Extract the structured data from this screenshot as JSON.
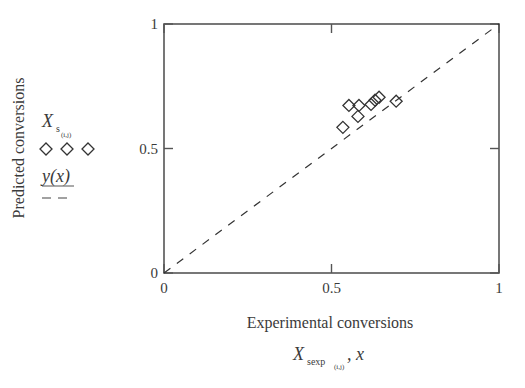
{
  "chart_data": {
    "type": "scatter",
    "title": "",
    "xlabel": "Experimental conversions",
    "xlabel_symbol": "X",
    "xlabel_symbol_sub": "sexp",
    "xlabel_symbol_subsub": "(i,j)",
    "xlabel_symbol_suffix": ", x",
    "ylabel": "Predicted conversions",
    "xlim": [
      0,
      1
    ],
    "ylim": [
      0,
      1
    ],
    "xticks": [
      0,
      0.5,
      1
    ],
    "yticks": [
      0,
      0.5,
      1
    ],
    "xtick_labels": [
      "0",
      "0.5",
      "1"
    ],
    "ytick_labels": [
      "0",
      "0.5",
      "1"
    ],
    "grid": false,
    "legend_position": "left, outside plot",
    "series": [
      {
        "name": "X_s(i,j)",
        "legend_symbol": "X",
        "legend_sub": "s",
        "legend_subsub": "(i,j)",
        "marker": "diamond-open",
        "points": [
          {
            "x": 0.534,
            "y": 0.585
          },
          {
            "x": 0.552,
            "y": 0.673
          },
          {
            "x": 0.582,
            "y": 0.673
          },
          {
            "x": 0.579,
            "y": 0.629
          },
          {
            "x": 0.618,
            "y": 0.677
          },
          {
            "x": 0.63,
            "y": 0.694
          },
          {
            "x": 0.642,
            "y": 0.706
          },
          {
            "x": 0.693,
            "y": 0.69
          }
        ]
      },
      {
        "name": "y(x)",
        "legend_symbol": "y(x)",
        "line_style": "dashed",
        "points": [
          {
            "x": 0,
            "y": 0
          },
          {
            "x": 1,
            "y": 1
          }
        ]
      }
    ]
  },
  "colors": {
    "axis": "#555555",
    "marker": "#333333",
    "line": "#333333",
    "text": "#3a3a3a"
  }
}
